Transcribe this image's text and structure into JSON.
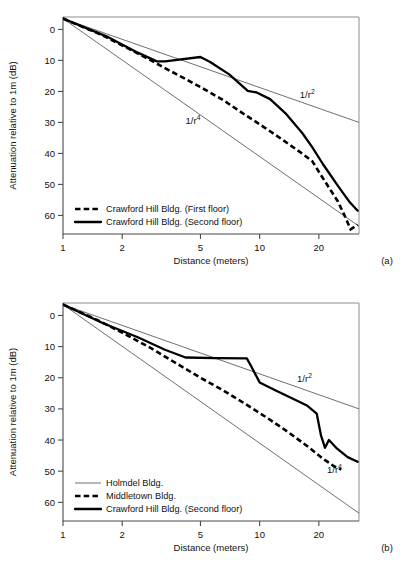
{
  "chart_data": [
    {
      "type": "line",
      "panel": "(a)",
      "title": "",
      "xlabel": "Distance (meters)",
      "ylabel": "Attenuation relative to 1m (dB)",
      "xscale": "log",
      "xlim": [
        1,
        32
      ],
      "ylim": [
        -4,
        66
      ],
      "yinverted": true,
      "xticks": [
        1,
        2,
        5,
        10,
        20
      ],
      "xticklabels": [
        "1",
        "2",
        "5",
        "10",
        "20"
      ],
      "yticks": [
        0,
        10,
        20,
        30,
        40,
        50,
        60
      ],
      "yticklabels": [
        "0",
        "10",
        "20",
        "30",
        "40",
        "50",
        "60"
      ],
      "grid": false,
      "legend_position": "lower-left",
      "annotations": [
        {
          "text": "1/r",
          "sup": "2",
          "x": 16.0,
          "y": 22.0
        },
        {
          "text": "1/r",
          "sup": "4",
          "x": 4.2,
          "y": 30.5
        }
      ],
      "series": [
        {
          "name": "1/r^2 reference",
          "style": "thin-solid",
          "in_legend": false,
          "x": [
            1,
            32
          ],
          "y": [
            -3.5,
            30.0
          ]
        },
        {
          "name": "1/r^4 reference",
          "style": "thin-solid",
          "in_legend": false,
          "x": [
            1,
            32
          ],
          "y": [
            -3.5,
            63.5
          ]
        },
        {
          "name": "Crawford Hill Bldg. (First floor)",
          "style": "thick-dashed",
          "in_legend": true,
          "x": [
            1.0,
            1.6,
            2.2,
            2.8,
            3.3,
            4.2,
            5.3,
            6.6,
            8.4,
            10.5,
            13.0,
            16.0,
            18.5,
            20.5,
            22.5,
            25.0,
            27.0,
            29.0,
            31.5
          ],
          "y": [
            -3.5,
            2.0,
            6.5,
            10.0,
            12.5,
            16.0,
            19.5,
            23.0,
            27.5,
            31.5,
            35.5,
            39.5,
            42.5,
            47.0,
            51.0,
            55.5,
            60.0,
            64.5,
            63.0
          ]
        },
        {
          "name": "Crawford Hill Bldg. (Second floor)",
          "style": "thick-solid",
          "in_legend": true,
          "x": [
            1.0,
            1.7,
            2.4,
            3.0,
            3.3,
            5.0,
            5.6,
            7.0,
            8.7,
            9.6,
            11.3,
            13.5,
            16.5,
            18.5,
            21.0,
            25.0,
            28.5,
            31.5
          ],
          "y": [
            -3.5,
            2.5,
            7.5,
            10.3,
            10.3,
            8.9,
            10.5,
            14.5,
            19.8,
            20.3,
            22.5,
            27.0,
            33.5,
            38.0,
            43.5,
            50.5,
            55.5,
            58.5
          ]
        }
      ],
      "legend": [
        {
          "label": "Crawford Hill Bldg. (First floor)",
          "style": "thick-dashed"
        },
        {
          "label": "Crawford Hill Bldg. (Second floor)",
          "style": "thick-solid"
        }
      ]
    },
    {
      "type": "line",
      "panel": "(b)",
      "title": "",
      "xlabel": "Distance (meters)",
      "ylabel": "Attenuation relative to 1m (dB)",
      "xscale": "log",
      "xlim": [
        1,
        32
      ],
      "ylim": [
        -4,
        66
      ],
      "yinverted": true,
      "xticks": [
        1,
        2,
        5,
        10,
        20
      ],
      "xticklabels": [
        "1",
        "2",
        "5",
        "10",
        "20"
      ],
      "yticks": [
        0,
        10,
        20,
        30,
        40,
        50,
        60
      ],
      "yticklabels": [
        "0",
        "10",
        "20",
        "30",
        "40",
        "50",
        "60"
      ],
      "grid": false,
      "legend_position": "lower-left",
      "annotations": [
        {
          "text": "1/r",
          "sup": "2",
          "x": 15.5,
          "y": 21.5
        },
        {
          "text": "1/r",
          "sup": "4",
          "x": 22.0,
          "y": 50.5
        }
      ],
      "series": [
        {
          "name": "Holmdel Bldg.",
          "style": "thin-solid",
          "in_legend": true,
          "x": [
            1,
            32
          ],
          "y": [
            -3.5,
            30.0
          ]
        },
        {
          "name": "1/r^4 reference",
          "style": "thin-solid",
          "in_legend": false,
          "x": [
            1,
            32
          ],
          "y": [
            -3.5,
            63.5
          ]
        },
        {
          "name": "Middletown Bldg.",
          "style": "thick-dashed",
          "in_legend": true,
          "x": [
            1.0,
            1.5,
            2.0,
            2.8,
            3.8,
            5.0,
            6.5,
            8.5,
            11.0,
            14.0,
            17.5,
            21.0,
            24.0,
            26.0
          ],
          "y": [
            -3.5,
            1.5,
            5.5,
            10.5,
            15.5,
            20.0,
            24.0,
            28.5,
            33.0,
            37.5,
            42.0,
            46.0,
            48.5,
            49.5
          ]
        },
        {
          "name": "Crawford Hill Bldg. (Second floor)",
          "style": "thick-solid",
          "in_legend": true,
          "x": [
            1.0,
            1.6,
            2.4,
            3.3,
            4.2,
            6.0,
            8.6,
            9.0,
            10.0,
            12.0,
            14.5,
            17.5,
            19.5,
            20.5,
            21.5,
            22.5,
            24.5,
            28.0,
            31.5
          ],
          "y": [
            -3.5,
            2.5,
            7.0,
            11.0,
            13.5,
            13.7,
            13.8,
            16.0,
            21.5,
            24.0,
            26.5,
            29.0,
            31.5,
            38.5,
            42.5,
            40.0,
            42.5,
            45.5,
            47.0
          ]
        }
      ],
      "legend": [
        {
          "label": "Holmdel Bldg.",
          "style": "thin-solid"
        },
        {
          "label": "Middletown Bldg.",
          "style": "thick-dashed"
        },
        {
          "label": "Crawford Hill Bldg. (Second floor)",
          "style": "thick-solid"
        }
      ]
    }
  ]
}
